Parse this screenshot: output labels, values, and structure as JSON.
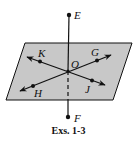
{
  "figure": {
    "caption": "Exs. 1-3",
    "colors": {
      "plane_fill": "#c8c8c8",
      "stroke": "#111111",
      "background": "#ffffff"
    },
    "plane": {
      "corners": [
        [
          25,
          43
        ],
        [
          132,
          43
        ],
        [
          113,
          100
        ],
        [
          6,
          100
        ]
      ]
    },
    "points": {
      "E": {
        "label": "E",
        "x": 69,
        "y": 15
      },
      "F": {
        "label": "F",
        "x": 68,
        "y": 117
      },
      "O": {
        "label": "O",
        "x": 68,
        "y": 71
      },
      "K": {
        "label": "K",
        "x": 40,
        "y": 61
      },
      "G": {
        "label": "G",
        "x": 97,
        "y": 61
      },
      "H": {
        "label": "H",
        "x": 33,
        "y": 86
      },
      "J": {
        "label": "J",
        "x": 92,
        "y": 80
      }
    },
    "lines": [
      {
        "name": "line-KJ",
        "through": [
          "K",
          "O",
          "J"
        ],
        "arrows": "both"
      },
      {
        "name": "line-HG",
        "through": [
          "H",
          "O",
          "G"
        ],
        "arrows": "both"
      },
      {
        "name": "segment-EF",
        "through": [
          "E",
          "O",
          "F"
        ],
        "dashed_part": "below O inside plane"
      }
    ]
  }
}
